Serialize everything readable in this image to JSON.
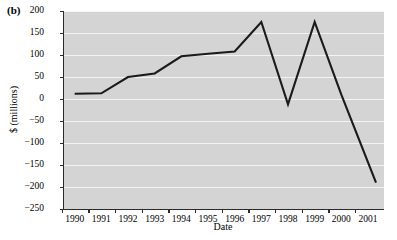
{
  "figure": {
    "panel_label": "(b)",
    "background_color": "#ffffff",
    "plot_background_color": "#d4d4d4",
    "gridline_color": "#f4f4f4",
    "axis_color": "#2b2b2b",
    "series_color": "#1a1a1a"
  },
  "chart_data": {
    "type": "line",
    "title": "",
    "xlabel": "Date",
    "ylabel": "$ (millions)",
    "xlim": [
      1989.6,
      2001.6
    ],
    "ylim": [
      -250,
      200
    ],
    "yticks": [
      200,
      150,
      100,
      50,
      0,
      -50,
      -100,
      -150,
      -200,
      -250
    ],
    "ytick_labels": [
      "200",
      "150",
      "100",
      "50",
      "0",
      "−50",
      "−100",
      "−150",
      "−200",
      "−250"
    ],
    "xticks": [
      1990,
      1991,
      1992,
      1993,
      1994,
      1995,
      1996,
      1997,
      1998,
      1999,
      2000,
      2001
    ],
    "xtick_labels": [
      "1990",
      "1991",
      "1992",
      "1993",
      "1994",
      "1995",
      "1996",
      "1997",
      "1998",
      "1999",
      "2000",
      "2001"
    ],
    "grid": "horizontal",
    "legend": "none",
    "series": [
      {
        "name": "Value",
        "x": [
          1990.0,
          1991.0,
          1992.0,
          1993.0,
          1994.0,
          1995.0,
          1996.0,
          1997.0,
          1998.0,
          1999.0,
          2000.0,
          2001.3
        ],
        "values": [
          12,
          13,
          50,
          58,
          97,
          103,
          108,
          175,
          -12,
          175,
          10,
          -190
        ]
      }
    ]
  }
}
